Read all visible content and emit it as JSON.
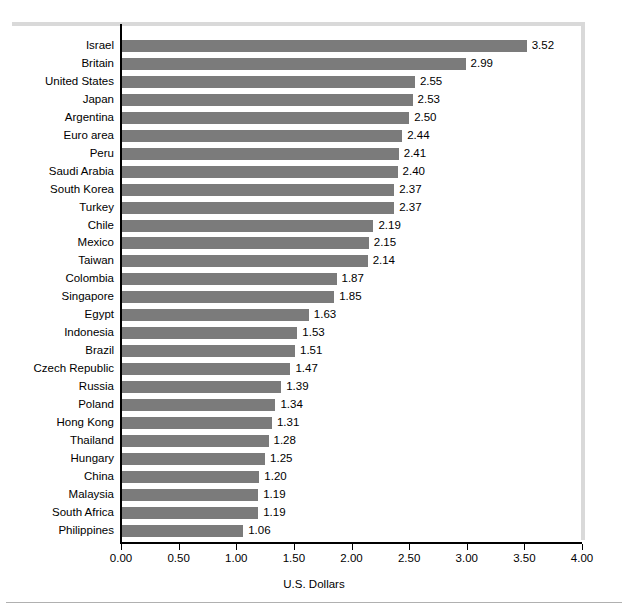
{
  "chart_data": {
    "type": "bar",
    "orientation": "horizontal",
    "title": "",
    "xlabel": "U.S. Dollars",
    "ylabel": "",
    "xlim": [
      0.0,
      4.0
    ],
    "xticks": [
      "0.00",
      "0.50",
      "1.00",
      "1.50",
      "2.00",
      "2.50",
      "3.00",
      "3.50",
      "4.00"
    ],
    "xtick_values": [
      0.0,
      0.5,
      1.0,
      1.5,
      2.0,
      2.5,
      3.0,
      3.5,
      4.0
    ],
    "grid": false,
    "legend": null,
    "bar_color": "#7b7b7b",
    "categories": [
      "Israel",
      "Britain",
      "United States",
      "Japan",
      "Argentina",
      "Euro area",
      "Peru",
      "Saudi Arabia",
      "South Korea",
      "Turkey",
      "Chile",
      "Mexico",
      "Taiwan",
      "Colombia",
      "Singapore",
      "Egypt",
      "Indonesia",
      "Brazil",
      "Czech Republic",
      "Russia",
      "Poland",
      "Hong Kong",
      "Thailand",
      "Hungary",
      "China",
      "Malaysia",
      "South Africa",
      "Philippines"
    ],
    "values": [
      3.52,
      2.99,
      2.55,
      2.53,
      2.5,
      2.44,
      2.41,
      2.4,
      2.37,
      2.37,
      2.19,
      2.15,
      2.14,
      1.87,
      1.85,
      1.63,
      1.53,
      1.51,
      1.47,
      1.39,
      1.34,
      1.31,
      1.28,
      1.25,
      1.2,
      1.19,
      1.19,
      1.06
    ],
    "value_labels": [
      "3.52",
      "2.99",
      "2.55",
      "2.53",
      "2.50",
      "2.44",
      "2.41",
      "2.40",
      "2.37",
      "2.37",
      "2.19",
      "2.15",
      "2.14",
      "1.87",
      "1.85",
      "1.63",
      "1.53",
      "1.51",
      "1.47",
      "1.39",
      "1.34",
      "1.31",
      "1.28",
      "1.25",
      "1.20",
      "1.19",
      "1.19",
      "1.06"
    ]
  }
}
